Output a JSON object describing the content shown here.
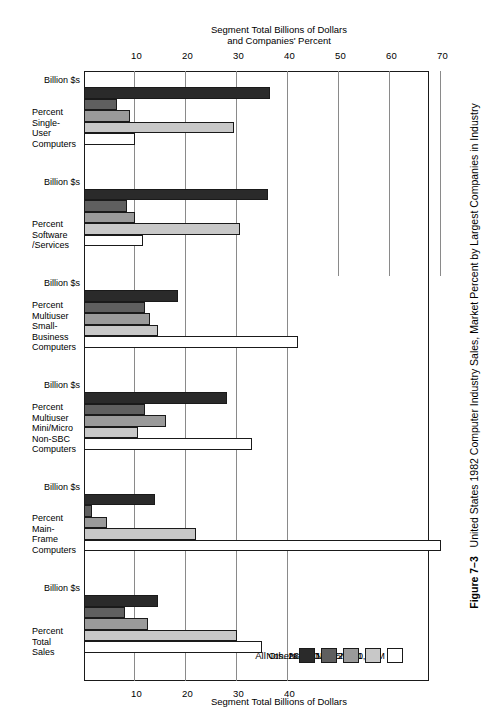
{
  "caption": {
    "figure_number": "Figure 7–3",
    "text": "United States 1982 Computer Industry Sales, Market Percent by Largest Companies in Industry"
  },
  "axes": {
    "top_title": "Segment Total Billions of Dollars",
    "bottom_title": "Segment Total Billions of Dollars\nand Companies' Percent",
    "top_ticks": [
      10,
      20,
      30,
      40
    ],
    "bottom_ticks": [
      10,
      20,
      30,
      40,
      50,
      60,
      70
    ],
    "unit_per_tick": 10,
    "max_top": 40,
    "max_bottom": 75
  },
  "legend": {
    "title": "",
    "items": [
      {
        "label": "No. 1, IBM",
        "color": "#ffffff",
        "key": "ibm"
      },
      {
        "label": "Nos. 2—10",
        "color": "#c8c8c8",
        "key": "n2_10"
      },
      {
        "label": "Nos. 11—25",
        "color": "#9a9a9a",
        "key": "n11_25"
      },
      {
        "label": "Nos. 26—50",
        "color": "#5f5f5f",
        "key": "n26_50"
      },
      {
        "label": "All Others",
        "color": "#2a2a2a",
        "key": "others"
      }
    ]
  },
  "sub_labels": {
    "percent": "Percent",
    "billion": "Billion $s"
  },
  "chart_data": {
    "type": "bar",
    "orientation": "horizontal",
    "title": "United States 1982 Computer Industry Sales, Market Percent by Largest Companies in Industry",
    "xlabel": "Segment Total Billions of Dollars and Companies' Percent",
    "ylabel": "",
    "grid": true,
    "legend_position": "top-left",
    "series_names": [
      "No. 1, IBM",
      "Nos. 2—10",
      "Nos. 11—25",
      "Nos. 26—50",
      "All Others"
    ],
    "groups": [
      {
        "name": "Total Sales",
        "label": "Percent\nTotal\nSales",
        "percent": [
          35.0,
          30.0,
          12.5,
          8.0,
          14.5
        ],
        "billion": []
      },
      {
        "name": "Main-Frame Computers",
        "label": "Percent\nMain-\nFrame\nComputers",
        "percent": [
          70.0,
          22.0,
          4.5,
          1.5,
          14.0
        ],
        "billion": []
      },
      {
        "name": "Multiuser Mini/Micro Non-SBC Computers",
        "label": "Percent\nMultiuser\nMini/Micro\nNon-SBC\nComputers",
        "percent": [
          33.0,
          10.5,
          16.0,
          12.0,
          28.0
        ],
        "billion": []
      },
      {
        "name": "Multiuser Small-Business Computers",
        "label": "Percent\nMultiuser\nSmall-\nBusiness\nComputers",
        "percent": [
          42.0,
          14.5,
          13.0,
          12.0,
          18.5
        ],
        "billion": []
      },
      {
        "name": "Software /Services",
        "label": "Percent\nSoftware\n/Services",
        "percent": [
          11.5,
          30.5,
          10.0,
          8.5,
          36.0
        ],
        "billion": []
      },
      {
        "name": "Single-User Computers",
        "label": "Percent\nSingle-\nUser\nComputers",
        "percent": [
          10.0,
          29.5,
          9.0,
          6.5,
          36.5
        ],
        "billion": []
      }
    ]
  }
}
